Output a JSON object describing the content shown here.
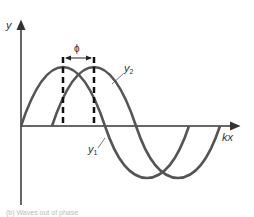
{
  "diagram": {
    "y_axis_label": "y",
    "x_axis_label": "kx",
    "phase_label": "ϕ",
    "curve_1": {
      "name": "y",
      "subscript": "1",
      "color": "#555555"
    },
    "curve_2": {
      "name": "y",
      "subscript": "2",
      "color": "#555555"
    },
    "axis_color": "#333333",
    "caption": "(b) Waves out of phase"
  }
}
